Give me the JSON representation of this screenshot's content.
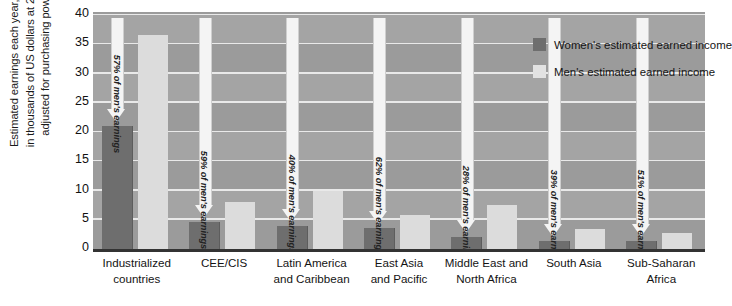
{
  "chart_data": {
    "type": "bar",
    "title": "",
    "xlabel": "",
    "ylabel": "Estimated earnings each year, measured in thousands of US dollars at 2003 prices adjusted for purchasing power parity",
    "ylim": [
      0,
      40
    ],
    "yticks": [
      0,
      5,
      10,
      15,
      20,
      25,
      30,
      35,
      40
    ],
    "grid": true,
    "legend_position": "top-right",
    "categories": [
      "Industrialized countries",
      "CEE/CIS",
      "Latin America and Caribbean",
      "East Asia and Pacific",
      "Middle East and North Africa",
      "South Asia",
      "Sub-Saharan Africa"
    ],
    "category_lines": [
      [
        "Industrialized",
        "countries"
      ],
      [
        "CEE/CIS"
      ],
      [
        "Latin America",
        "and Caribbean"
      ],
      [
        "East Asia",
        "and Pacific"
      ],
      [
        "Middle East and",
        "North Africa"
      ],
      [
        "South Asia"
      ],
      [
        "Sub-Saharan",
        "Africa"
      ]
    ],
    "series": [
      {
        "name": "Women's estimated earned income",
        "color": "#6e6e6e",
        "values": [
          21.0,
          4.7,
          4.0,
          3.6,
          2.1,
          1.4,
          1.4
        ]
      },
      {
        "name": "Men's estimated earned income",
        "color": "#dcdcdc",
        "values": [
          36.5,
          8.0,
          10.0,
          5.8,
          7.5,
          3.4,
          2.7
        ]
      }
    ],
    "annotations": [
      "57% of men's earnings",
      "59% of men's earnings",
      "40% of men's earnings",
      "62% of men's earnings",
      "28% of men's earnings",
      "39% of men's earnings",
      "51% of men's earnings"
    ],
    "annotation_ratios": [
      57,
      59,
      40,
      62,
      28,
      39,
      51
    ]
  },
  "legend": {
    "items": [
      {
        "label": "Women's estimated earned income",
        "color": "#6e6e6e"
      },
      {
        "label": "Men's estimated earned income",
        "color": "#e2e2e2"
      }
    ]
  },
  "axis": {
    "y_title_lines": [
      "Estimated earnings each year, measured",
      "in thousands of US dollars at 2003 prices",
      "adjusted for purchasing power parity"
    ]
  },
  "colors": {
    "plot_background": "#9b9b9b",
    "band": "#a4a4a4",
    "gridline": "#e9e9e9",
    "women_bar": "#6e6e6e",
    "men_bar": "#dcdcdc",
    "arrow": "#f4f4f4",
    "axis_line": "#333333"
  }
}
